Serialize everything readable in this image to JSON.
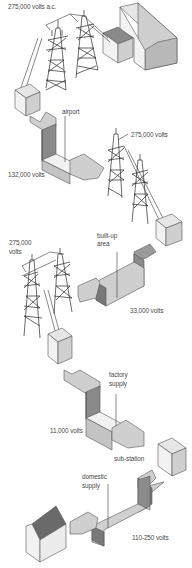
{
  "diagram": {
    "labels": {
      "top_voltage": "275,000 volts a.c.",
      "airport": "airport",
      "v132": "132,000 volts",
      "v275_right": "275,000 volts",
      "v275_left_line1": "275,000",
      "v275_left_line2": "volts",
      "builtup_line1": "built-up",
      "builtup_line2": "area",
      "v33": "33,000 volts",
      "factory_line1": "factory",
      "factory_line2": "supply",
      "v11": "11,000 volts",
      "substation": "sub-station",
      "domestic_line1": "domestic",
      "domestic_line2": "supply",
      "v110_250": "110-250 volts"
    },
    "components": [
      {
        "type": "power-station",
        "name": "power station"
      },
      {
        "type": "pylon",
        "count": 2,
        "voltage": "275,000 volts a.c."
      },
      {
        "type": "transformer",
        "name": "transformer 1"
      },
      {
        "type": "supply-arrow",
        "destination": "airport",
        "voltage": "132,000 volts"
      },
      {
        "type": "pylon",
        "count": 2,
        "voltage": "275,000 volts"
      },
      {
        "type": "transformer",
        "name": "transformer 2"
      },
      {
        "type": "supply-arrow",
        "destination": "built-up area",
        "voltage": "33,000 volts"
      },
      {
        "type": "pylon",
        "count": 2,
        "voltage": "275,000 volts"
      },
      {
        "type": "transformer",
        "name": "transformer 3"
      },
      {
        "type": "supply-arrow",
        "destination": "factory supply",
        "voltage": "11,000 volts"
      },
      {
        "type": "transformer",
        "name": "sub-station"
      },
      {
        "type": "supply-arrow",
        "destination": "domestic supply",
        "voltage": "110-250 volts"
      },
      {
        "type": "house",
        "name": "house"
      }
    ]
  }
}
